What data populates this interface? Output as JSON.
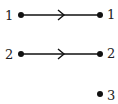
{
  "diagram": {
    "type": "mapping",
    "domain_labels": [
      "1",
      "2"
    ],
    "codomain_labels": [
      "1",
      "2",
      "3"
    ],
    "arrows": [
      {
        "from": "1",
        "to": "1"
      },
      {
        "from": "2",
        "to": "2"
      }
    ],
    "color": "#111111"
  }
}
